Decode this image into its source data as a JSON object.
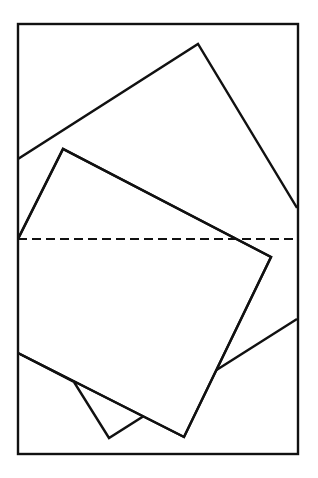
{
  "diagram": {
    "stroke_color": "#111111",
    "background": "#ffffff",
    "frame": {
      "x": 18,
      "y": 24,
      "width": 280,
      "height": 430
    },
    "large_square": {
      "points": "18,159 198,44 297,208",
      "bottom_points": "297,319 142,417 109,438 74,382 18,353"
    },
    "small_square": {
      "points": "18,239 63,149 271,257 184,437 18,353"
    },
    "dashed_line": {
      "y": 239,
      "x1": 18,
      "x2": 298
    }
  }
}
